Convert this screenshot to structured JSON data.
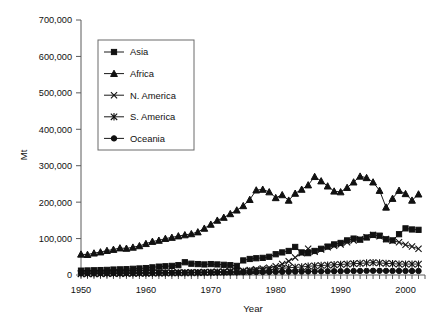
{
  "chart_data": {
    "type": "line",
    "title": "",
    "xlabel": "Year",
    "ylabel": "Mt",
    "xlim": [
      1950,
      2003
    ],
    "ylim": [
      0,
      700000
    ],
    "xticks": [
      1950,
      1960,
      1970,
      1980,
      1990,
      2000
    ],
    "yticks": [
      0,
      100000,
      200000,
      300000,
      400000,
      500000,
      600000,
      700000
    ],
    "ytick_labels": [
      "0",
      "100,000",
      "200,000",
      "300,000",
      "400,000",
      "500,000",
      "600,000",
      "700,000"
    ],
    "xtick_labels": [
      "1950",
      "1960",
      "1970",
      "1980",
      "1990",
      "2000"
    ],
    "grid": false,
    "legend_position": "upper-left-inside",
    "x": [
      1950,
      1951,
      1952,
      1953,
      1954,
      1955,
      1956,
      1957,
      1958,
      1959,
      1960,
      1961,
      1962,
      1963,
      1964,
      1965,
      1966,
      1967,
      1968,
      1969,
      1970,
      1971,
      1972,
      1973,
      1974,
      1975,
      1976,
      1977,
      1978,
      1979,
      1980,
      1981,
      1982,
      1983,
      1984,
      1985,
      1986,
      1987,
      1988,
      1989,
      1990,
      1991,
      1992,
      1993,
      1994,
      1995,
      1996,
      1997,
      1998,
      1999,
      2000,
      2001,
      2002
    ],
    "series": [
      {
        "name": "Asia",
        "marker": "square",
        "values": [
          12000,
          12500,
          13000,
          13500,
          14000,
          15000,
          15500,
          16000,
          17000,
          18000,
          19000,
          21000,
          23000,
          24000,
          25000,
          27000,
          35000,
          31000,
          30000,
          29000,
          30000,
          29000,
          28000,
          27000,
          25000,
          40000,
          44000,
          46000,
          47000,
          50000,
          57000,
          62000,
          66000,
          77000,
          62000,
          60000,
          66000,
          72000,
          78000,
          84000,
          88000,
          95000,
          100000,
          97000,
          103000,
          110000,
          108000,
          98000,
          95000,
          112000,
          128000,
          125000,
          124000
        ]
      },
      {
        "name": "Africa",
        "marker": "triangle",
        "values": [
          57000,
          56000,
          60000,
          63000,
          67000,
          70000,
          74000,
          73000,
          76000,
          80000,
          86000,
          92000,
          95000,
          100000,
          103000,
          107000,
          110000,
          113000,
          118000,
          128000,
          139000,
          150000,
          158000,
          168000,
          178000,
          190000,
          207000,
          233000,
          235000,
          228000,
          212000,
          220000,
          205000,
          224000,
          235000,
          247000,
          270000,
          258000,
          244000,
          230000,
          228000,
          240000,
          255000,
          271000,
          267000,
          255000,
          232000,
          186000,
          210000,
          232000,
          223000,
          205000,
          222000
        ]
      },
      {
        "name": "N. America",
        "marker": "x",
        "values": [
          4000,
          4000,
          4200,
          4300,
          4500,
          4800,
          5000,
          5200,
          5400,
          5600,
          5800,
          6000,
          6300,
          6500,
          6800,
          7000,
          7200,
          7500,
          7800,
          8000,
          8500,
          9000,
          9500,
          10000,
          11000,
          12000,
          14000,
          16000,
          18000,
          20000,
          24000,
          30000,
          38000,
          48000,
          60000,
          72000,
          64000,
          70000,
          76000,
          80000,
          84000,
          90000,
          95000,
          98000,
          104000,
          110000,
          106000,
          99000,
          94000,
          90000,
          83000,
          78000,
          72000
        ]
      },
      {
        "name": "S. America",
        "marker": "asterisk",
        "values": [
          3000,
          3000,
          3200,
          3300,
          3400,
          3600,
          3800,
          4000,
          4200,
          4400,
          4600,
          4800,
          5000,
          5200,
          5400,
          5600,
          5800,
          6000,
          6200,
          6500,
          7000,
          7500,
          8000,
          8500,
          9000,
          10000,
          11000,
          12000,
          13000,
          14000,
          16000,
          18000,
          20000,
          21000,
          22000,
          24000,
          25000,
          26000,
          27000,
          28000,
          29000,
          30000,
          31000,
          32000,
          33000,
          34000,
          33000,
          32000,
          31000,
          30000,
          30000,
          30000,
          30000
        ]
      },
      {
        "name": "Oceania",
        "marker": "circle",
        "values": [
          5000,
          5000,
          5200,
          5300,
          5400,
          5500,
          5600,
          5700,
          5800,
          5900,
          6000,
          6100,
          6200,
          6300,
          6400,
          6500,
          6600,
          6700,
          6800,
          6900,
          7000,
          7100,
          7200,
          7300,
          7400,
          7600,
          7800,
          8000,
          8200,
          8400,
          8600,
          8800,
          9000,
          9200,
          9400,
          9600,
          9800,
          10000,
          10200,
          10400,
          10600,
          10800,
          11000,
          11200,
          11400,
          11600,
          11500,
          11400,
          11300,
          11200,
          11100,
          11000,
          11000
        ]
      }
    ]
  },
  "caption": {
    "text": ""
  }
}
